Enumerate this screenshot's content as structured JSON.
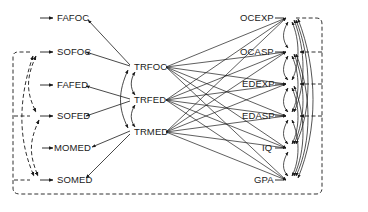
{
  "diagram": {
    "type": "path-diagram",
    "colors": {
      "line": "#1a1a1a",
      "background": "#ffffff"
    },
    "exogenous": [
      {
        "id": "FAFOC",
        "label": "FAFOC"
      },
      {
        "id": "SOFOC",
        "label": "SOFOC"
      },
      {
        "id": "FAFED",
        "label": "FAFED"
      },
      {
        "id": "SOFED",
        "label": "SOFED"
      },
      {
        "id": "MOMED",
        "label": "MOMED"
      },
      {
        "id": "SOMED",
        "label": "SOMED"
      }
    ],
    "intermediate": [
      {
        "id": "TRFOC",
        "label": "TRFOC"
      },
      {
        "id": "TRFED",
        "label": "TRFED"
      },
      {
        "id": "TRMED",
        "label": "TRMED"
      }
    ],
    "outcomes": [
      {
        "id": "OCEXP",
        "label": "OCEXP"
      },
      {
        "id": "OCASP",
        "label": "OCASP"
      },
      {
        "id": "EDEXP",
        "label": "EDEXP"
      },
      {
        "id": "EDASP",
        "label": "EDASP"
      },
      {
        "id": "IQ",
        "label": "IQ"
      },
      {
        "id": "GPA",
        "label": "GPA"
      }
    ],
    "edges": {
      "true_to_reported": [
        [
          "TRFOC",
          "FAFOC"
        ],
        [
          "TRFOC",
          "SOFOC"
        ],
        [
          "TRFED",
          "FAFED"
        ],
        [
          "TRFED",
          "SOFED"
        ],
        [
          "TRMED",
          "MOMED"
        ],
        [
          "TRMED",
          "SOMED"
        ]
      ],
      "true_to_outcomes": "all intermediate nodes point to all outcome nodes",
      "intermediate_correlations": [
        [
          "TRFOC",
          "TRFED"
        ],
        [
          "TRFED",
          "TRMED"
        ],
        [
          "TRFOC",
          "TRMED"
        ]
      ],
      "outcome_correlations": "curved double-headed arcs among all outcome nodes",
      "error_correlations_dashed_left": [
        [
          "SOFOC",
          "SOFED"
        ],
        [
          "SOFED",
          "SOMED"
        ],
        [
          "SOFOC",
          "SOMED"
        ]
      ],
      "error_correlations_dashed_loop": "dashed loop linking SOFOC/SOFED/SOMED errors with OCEXP/OCASP/EDEXP/EDASP errors"
    }
  }
}
